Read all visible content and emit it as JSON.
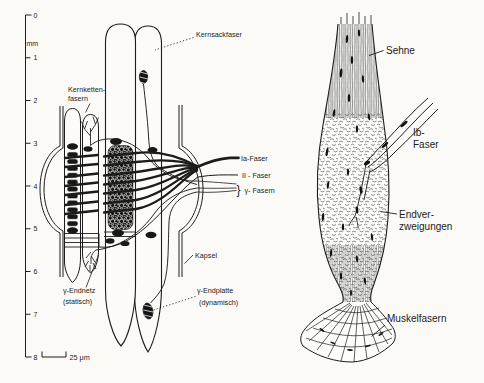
{
  "figure": {
    "background": "#fbfaf7",
    "ink_color": "#1c1c1c",
    "description_left": "muscle spindle schematic",
    "description_right": "golgi tendon organ schematic"
  },
  "left": {
    "ruler": {
      "unit": "mm",
      "ticks": [
        "0",
        "1",
        "2",
        "3",
        "4",
        "5",
        "6",
        "7",
        "8"
      ]
    },
    "scale_bar": "25 μm",
    "labels": {
      "kernsackfaser": "Kernsackfaser",
      "kernketten_line1": "Kernketten-",
      "kernketten_line2": "fasern",
      "ia_faser": "Ia-Faser",
      "ii_faser": "II - Faser",
      "gamma_brace": "}",
      "gamma_fasern": "γ- Fasern",
      "kapsel": "Kapsel",
      "endnetz_line1": "γ-Endnetz",
      "endnetz_line2": "(statisch)",
      "endplatte_line1": "γ-Endplatte",
      "endplatte_line2": "(dynamisch)"
    }
  },
  "right": {
    "labels": {
      "sehne": "Sehne",
      "ib_line1": "Ib-",
      "ib_line2": "Faser",
      "endver_line1": "Endver-",
      "endver_line2": "zweigungen",
      "muskelfasern": "Muskelfasern"
    }
  }
}
